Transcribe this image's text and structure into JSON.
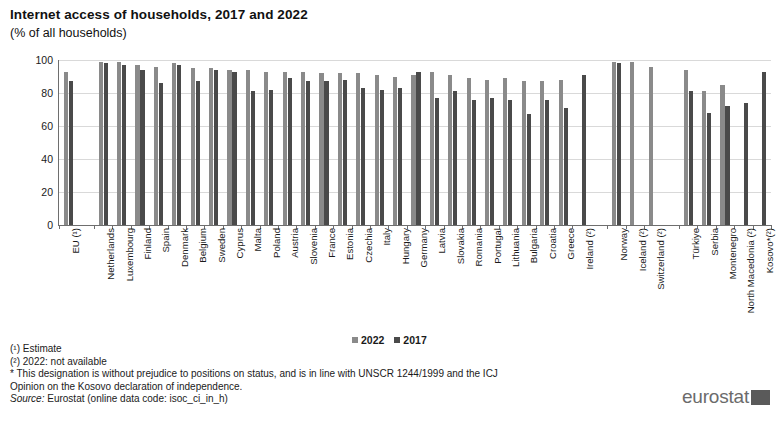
{
  "header": {
    "title": "Internet access of households, 2017 and 2022",
    "subtitle": "(% of all households)"
  },
  "legend": {
    "items": [
      {
        "label": "2022",
        "color": "#8a8a8a"
      },
      {
        "label": "2017",
        "color": "#4a4a4a"
      }
    ]
  },
  "notes": {
    "line1": "(¹) Estimate",
    "line2": "(²) 2022: not available",
    "line3": "* This designation is without prejudice to positions on status, and is in line with UNSCR  1244/1999 and the ICJ",
    "line4": "Opinion on the Kosovo declaration of independence.",
    "source_label": "Source:",
    "source_text": " Eurostat (online data code: isoc_ci_in_h)"
  },
  "brand": {
    "name": "eurostat"
  },
  "chart_data": {
    "type": "bar",
    "title": "Internet access of households, 2017 and 2022",
    "subtitle": "(% of all households)",
    "xlabel": "",
    "ylabel": "",
    "ylim": [
      0,
      100
    ],
    "yticks": [
      0,
      20,
      40,
      60,
      80,
      100
    ],
    "grid": true,
    "legend_position": "bottom-center",
    "categories": [
      "EU (¹)",
      "Netherlands",
      "Luxembourg",
      "Finland",
      "Spain",
      "Denmark",
      "Belgium",
      "Sweden",
      "Cyprus",
      "Malta",
      "Poland",
      "Austria",
      "Slovenia",
      "France",
      "Estonia",
      "Czechia",
      "Italy",
      "Hungary",
      "Germany",
      "Latvia",
      "Slovakia",
      "Romania",
      "Portugal",
      "Lithuania",
      "Bulgaria",
      "Croatia",
      "Greece",
      "Ireland (²)",
      "Norway",
      "Iceland (²)",
      "Switzerland (²)",
      "Türkiye",
      "Serbia",
      "Montenegro",
      "North Macedonia (²)",
      "Kosovo*(²)"
    ],
    "group_breaks": [
      1,
      28,
      31
    ],
    "series": [
      {
        "name": "2022",
        "color": "#8a8a8a",
        "values": [
          93,
          99,
          99,
          97,
          96,
          98,
          95,
          95,
          94,
          94,
          93,
          93,
          93,
          92,
          92,
          92,
          91,
          90,
          91,
          93,
          91,
          89,
          88,
          89,
          87,
          87,
          88,
          null,
          99,
          99,
          96,
          94,
          81,
          85,
          null,
          null
        ]
      },
      {
        "name": "2017",
        "color": "#4a4a4a",
        "values": [
          87,
          98,
          97,
          94,
          86,
          97,
          87,
          94,
          93,
          81,
          82,
          89,
          87,
          87,
          88,
          83,
          82,
          83,
          93,
          77,
          81,
          76,
          77,
          76,
          67,
          76,
          71,
          91,
          98,
          null,
          null,
          81,
          68,
          72,
          74,
          93
        ]
      }
    ]
  }
}
